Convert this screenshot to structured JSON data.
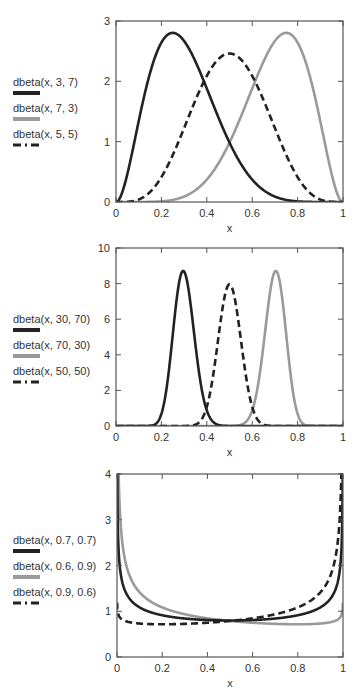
{
  "colors": {
    "dark": "#222222",
    "gray": "#9a9a9a",
    "frame": "#555555",
    "text": "#333333"
  },
  "chart_data": [
    {
      "type": "line",
      "title": "",
      "xlabel": "x",
      "ylabel": "",
      "xlim": [
        0,
        1
      ],
      "ylim": [
        0,
        3
      ],
      "xticks": [
        0,
        0.2,
        0.4,
        0.6,
        0.8,
        1
      ],
      "xtick_labels": [
        "0",
        "0.2",
        "0.4",
        "0.6",
        "0.8",
        "1"
      ],
      "yticks": [
        0,
        1,
        2,
        3
      ],
      "ytick_labels": [
        "0",
        "1",
        "2",
        "3"
      ],
      "grid": false,
      "legend_position": "left",
      "box": {
        "left": 116,
        "top": 21,
        "right": 343,
        "bottom": 202
      },
      "legend_top": 76,
      "series": [
        {
          "name": "dbeta(x, 3, 7)",
          "alpha": 3,
          "beta": 7,
          "color": "#222222",
          "style": "solid",
          "peak": {
            "x": 0.25,
            "y": 2.78
          }
        },
        {
          "name": "dbeta(x, 7, 3)",
          "alpha": 7,
          "beta": 3,
          "color": "#9a9a9a",
          "style": "solid",
          "peak": {
            "x": 0.75,
            "y": 2.78
          }
        },
        {
          "name": "dbeta(x, 5, 5)",
          "alpha": 5,
          "beta": 5,
          "color": "#222222",
          "style": "dashed",
          "peak": {
            "x": 0.5,
            "y": 2.46
          }
        }
      ]
    },
    {
      "type": "line",
      "title": "",
      "xlabel": "x",
      "ylabel": "",
      "xlim": [
        0,
        1
      ],
      "ylim": [
        0,
        10
      ],
      "xticks": [
        0,
        0.2,
        0.4,
        0.6,
        0.8,
        1
      ],
      "xtick_labels": [
        "0",
        "0.2",
        "0.4",
        "0.6",
        "0.8",
        "1"
      ],
      "yticks": [
        0,
        2,
        4,
        6,
        8,
        10
      ],
      "ytick_labels": [
        "0",
        "2",
        "4",
        "6",
        "8",
        "10"
      ],
      "grid": false,
      "legend_position": "left",
      "box": {
        "left": 116,
        "top": 248,
        "right": 343,
        "bottom": 426
      },
      "legend_top": 313,
      "series": [
        {
          "name": "dbeta(x, 30, 70)",
          "alpha": 30,
          "beta": 70,
          "color": "#222222",
          "style": "solid",
          "peak": {
            "x": 0.29,
            "y": 8.7
          }
        },
        {
          "name": "dbeta(x, 70, 30)",
          "alpha": 70,
          "beta": 30,
          "color": "#9a9a9a",
          "style": "solid",
          "peak": {
            "x": 0.71,
            "y": 8.7
          }
        },
        {
          "name": "dbeta(x, 50, 50)",
          "alpha": 50,
          "beta": 50,
          "color": "#222222",
          "style": "dashed",
          "peak": {
            "x": 0.5,
            "y": 7.96
          }
        }
      ]
    },
    {
      "type": "line",
      "title": "",
      "xlabel": "x",
      "ylabel": "",
      "xlim": [
        0,
        1
      ],
      "ylim": [
        0,
        4
      ],
      "xticks": [
        0,
        0.2,
        0.4,
        0.6,
        0.8,
        1
      ],
      "xtick_labels": [
        "0",
        "0.2",
        "0.4",
        "0.6",
        "0.8",
        "1"
      ],
      "yticks": [
        0,
        1,
        2,
        3,
        4
      ],
      "ytick_labels": [
        "0",
        "1",
        "2",
        "3",
        "4"
      ],
      "grid": false,
      "legend_position": "left",
      "box": {
        "left": 117,
        "top": 474,
        "right": 343,
        "bottom": 657
      },
      "legend_top": 534,
      "series": [
        {
          "name": "dbeta(x, 0.7, 0.7)",
          "alpha": 0.7,
          "beta": 0.7,
          "color": "#222222",
          "style": "solid",
          "min": {
            "x": 0.5,
            "y": 0.81
          }
        },
        {
          "name": "dbeta(x, 0.6, 0.9)",
          "alpha": 0.6,
          "beta": 0.9,
          "color": "#9a9a9a",
          "style": "solid",
          "min": {
            "x": 0.8,
            "y": 0.72
          }
        },
        {
          "name": "dbeta(x, 0.9, 0.6)",
          "alpha": 0.9,
          "beta": 0.6,
          "color": "#222222",
          "style": "dashed",
          "min": {
            "x": 0.2,
            "y": 0.72
          }
        }
      ]
    }
  ]
}
